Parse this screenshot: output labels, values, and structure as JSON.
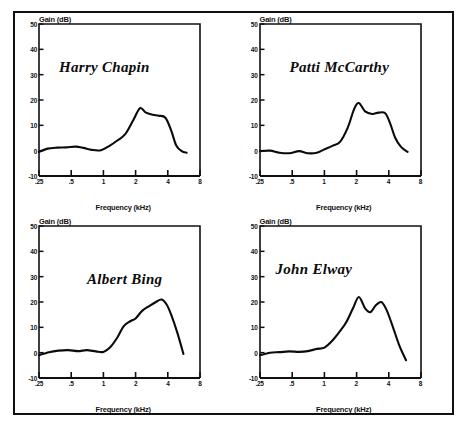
{
  "figure": {
    "panel_count": 4,
    "frame_color": "#101010",
    "curve_color": "#0b0b0b",
    "background": "#ffffff"
  },
  "axes": {
    "ylabel": "Gain (dB)",
    "xlabel": "Frequency (kHz)",
    "yticks": [
      "50",
      "40",
      "30",
      "20",
      "10",
      "0",
      "-10"
    ],
    "ytick_values": [
      50,
      40,
      30,
      20,
      10,
      0,
      -10
    ],
    "xticks": [
      ".25",
      ".5",
      "1",
      "2",
      "4",
      "8"
    ],
    "xtick_values": [
      0.25,
      0.5,
      1,
      2,
      4,
      8
    ],
    "ylim": [
      -10,
      50
    ],
    "xlim": [
      0.25,
      8
    ],
    "xscale": "log",
    "grid": "off"
  },
  "chart_data": [
    {
      "type": "line",
      "title": "Harry Chapin",
      "xlabel": "Frequency (kHz)",
      "ylabel": "Gain (dB)",
      "xscale": "log",
      "xlim": [
        0.25,
        8
      ],
      "ylim": [
        -10,
        50
      ],
      "x": [
        0.25,
        0.3,
        0.37,
        0.45,
        0.55,
        0.65,
        0.78,
        0.95,
        1.15,
        1.35,
        1.6,
        1.9,
        2.2,
        2.5,
        2.9,
        3.3,
        3.8,
        4.3,
        4.8,
        5.4,
        6.0
      ],
      "y": [
        -0.5,
        0.8,
        1.2,
        1.3,
        1.6,
        1.1,
        0.3,
        0.2,
        2.0,
        4.0,
        6.5,
        12.0,
        16.8,
        15.0,
        14.2,
        13.8,
        13.0,
        8.0,
        2.0,
        -0.2,
        -0.8
      ]
    },
    {
      "type": "line",
      "title": "Patti McCarthy",
      "xlabel": "Frequency (kHz)",
      "ylabel": "Gain (dB)",
      "xscale": "log",
      "xlim": [
        0.25,
        8
      ],
      "ylim": [
        -10,
        50
      ],
      "x": [
        0.25,
        0.31,
        0.38,
        0.47,
        0.58,
        0.7,
        0.85,
        1.0,
        1.2,
        1.4,
        1.65,
        1.9,
        2.1,
        2.4,
        2.8,
        3.2,
        3.7,
        4.1,
        4.6,
        5.2,
        6.0
      ],
      "y": [
        -0.2,
        0.0,
        -0.8,
        -1.0,
        -0.2,
        -1.0,
        -0.8,
        0.5,
        2.0,
        3.5,
        9.0,
        16.5,
        18.8,
        15.5,
        14.5,
        15.0,
        14.8,
        11.0,
        5.0,
        1.5,
        -0.5
      ]
    },
    {
      "type": "line",
      "title": "Albert Bing",
      "xlabel": "Frequency (kHz)",
      "ylabel": "Gain (dB)",
      "xscale": "log",
      "xlim": [
        0.25,
        8
      ],
      "ylim": [
        -10,
        50
      ],
      "x": [
        0.25,
        0.31,
        0.38,
        0.47,
        0.58,
        0.7,
        0.85,
        1.0,
        1.15,
        1.35,
        1.55,
        1.8,
        2.0,
        2.3,
        2.7,
        3.1,
        3.5,
        3.9,
        4.3,
        4.9,
        5.6
      ],
      "y": [
        -1.0,
        0.2,
        0.8,
        1.0,
        0.6,
        1.0,
        0.5,
        0.3,
        2.0,
        6.0,
        10.5,
        12.5,
        13.5,
        16.5,
        18.5,
        20.0,
        21.0,
        19.0,
        15.0,
        8.0,
        -0.5
      ]
    },
    {
      "type": "line",
      "title": "John Elway",
      "xlabel": "Frequency (kHz)",
      "ylabel": "Gain (dB)",
      "xscale": "log",
      "xlim": [
        0.25,
        8
      ],
      "ylim": [
        -10,
        50
      ],
      "x": [
        0.25,
        0.31,
        0.38,
        0.47,
        0.58,
        0.7,
        0.85,
        1.0,
        1.2,
        1.4,
        1.6,
        1.85,
        2.1,
        2.4,
        2.7,
        3.0,
        3.4,
        3.8,
        4.3,
        5.0,
        5.8
      ],
      "y": [
        -1.0,
        0.0,
        0.2,
        0.5,
        0.3,
        0.6,
        1.5,
        2.0,
        5.0,
        8.5,
        12.0,
        17.5,
        22.0,
        17.5,
        16.0,
        18.5,
        20.0,
        17.0,
        11.0,
        3.0,
        -3.0
      ]
    }
  ]
}
